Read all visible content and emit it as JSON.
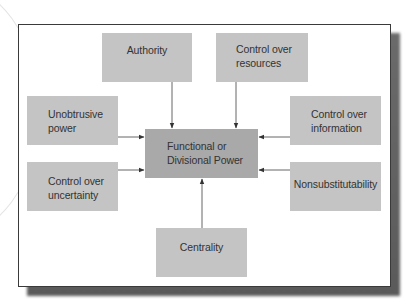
{
  "diagram": {
    "center": {
      "label": "Functional or\nDivisional Power"
    },
    "sources": [
      {
        "id": "authority",
        "label": "Authority",
        "arrow_to_center": "down"
      },
      {
        "id": "control-over-resources",
        "label": "Control over\nresources",
        "arrow_to_center": "down"
      },
      {
        "id": "unobtrusive-power",
        "label": "Unobtrusive\npower",
        "arrow_to_center": "right"
      },
      {
        "id": "control-over-uncertainty",
        "label": "Control over\nuncertainty",
        "arrow_to_center": "right"
      },
      {
        "id": "control-over-information",
        "label": "Control over\ninformation",
        "arrow_to_center": "left"
      },
      {
        "id": "nonsubstitutability",
        "label": "Nonsubstitutability",
        "arrow_to_center": "left"
      },
      {
        "id": "centrality",
        "label": "Centrality",
        "arrow_to_center": "up"
      }
    ],
    "colors": {
      "node_fill": "#c4c4c4",
      "center_fill": "#a9a9a9",
      "text": "#333333",
      "arrow": "#333333",
      "frame_border": "#3a3a3a",
      "shadow": "#5f5f5f"
    }
  }
}
